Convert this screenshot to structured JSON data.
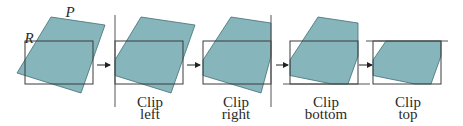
{
  "colors": {
    "polygon_fill": "#86b6bc",
    "polygon_stroke": "#3f6e74",
    "rect_stroke": "#3a3a3a",
    "line_stroke": "#555555",
    "text": "#2a2a2a"
  },
  "labels": {
    "polygon": "P",
    "rectangle": "R"
  },
  "steps": [
    {
      "line1": "Clip",
      "line2": "left"
    },
    {
      "line1": "Clip",
      "line2": "right"
    },
    {
      "line1": "Clip",
      "line2": "bottom"
    },
    {
      "line1": "Clip",
      "line2": "top"
    }
  ]
}
